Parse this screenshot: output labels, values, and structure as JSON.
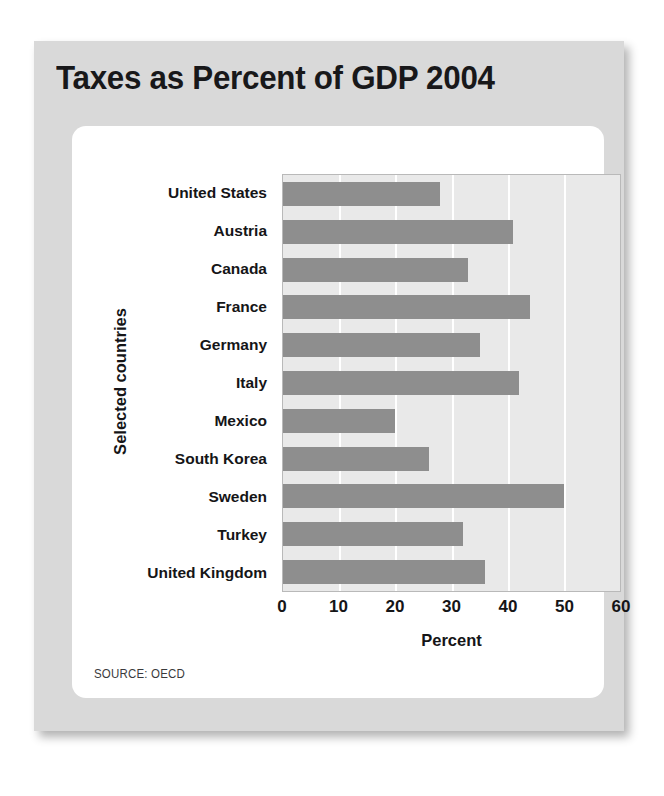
{
  "title": "Taxes as Percent of GDP 2004",
  "source_note": "SOURCE: OECD",
  "colors": {
    "page_background": "#ffffff",
    "card_background": "#d9d9d9",
    "panel_background": "#ffffff",
    "plot_background": "#e9e9e9",
    "bar_fill": "#8e8e8e",
    "gridline": "#ffffff",
    "text": "#151517"
  },
  "chart_data": {
    "type": "bar",
    "orientation": "horizontal",
    "title": "Taxes as Percent of GDP 2004",
    "xlabel": "Percent",
    "ylabel": "Selected countries",
    "categories": [
      "United States",
      "Austria",
      "Canada",
      "France",
      "Germany",
      "Italy",
      "Mexico",
      "South Korea",
      "Sweden",
      "Turkey",
      "United Kingdom"
    ],
    "values": [
      28,
      41,
      33,
      44,
      35,
      42,
      20,
      26,
      50,
      32,
      36
    ],
    "xlim": [
      0,
      60
    ],
    "xticks": [
      0,
      10,
      20,
      30,
      40,
      50,
      60
    ],
    "xtick_labels": [
      "0",
      "10",
      "20",
      "30",
      "40",
      "50",
      "60"
    ],
    "grid": true,
    "grid_axis": "x",
    "legend": false,
    "series": [
      {
        "name": "Taxes as percent of GDP",
        "values": [
          28,
          41,
          33,
          44,
          35,
          42,
          20,
          26,
          50,
          32,
          36
        ]
      }
    ]
  }
}
